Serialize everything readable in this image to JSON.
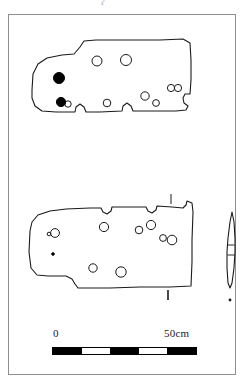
{
  "figure": {
    "domain_note": "archaeological artefact illustration plate",
    "top_cut_mark": "ʔ",
    "frame": {
      "x": 8,
      "y": 14,
      "width": 228,
      "height": 361,
      "border_color": "#8e8e8e"
    },
    "ink_color": "#1a1a1a",
    "fill_black": "#000000",
    "paper_color": "#ffffff"
  },
  "scale": {
    "zero_label": "0",
    "max_label": "50cm",
    "bar": {
      "x": 52,
      "y": 347,
      "width": 145,
      "height": 8,
      "segments": [
        {
          "tone": "dark",
          "weight": 1
        },
        {
          "tone": "light",
          "weight": 1
        },
        {
          "tone": "dark",
          "weight": 1
        },
        {
          "tone": "light",
          "weight": 1
        },
        {
          "tone": "dark",
          "weight": 1
        }
      ]
    }
  },
  "artefacts": {
    "upper_plan": {
      "label": "upper-stone-plan",
      "outline": "M 32 90 L 33 74 L 38 64 L 47 58 L 62 55 L 74 54 L 80 47 L 84 41 L 96 40 L 130 40 L 160 40 L 183 39 L 190 43 L 191 60 L 191 80 L 190 94 L 185 94 L 183 98 L 184 103 L 188 106 L 186 110 L 176 111 L 150 111 L 133 111 L 131 106 L 127 103 L 123 106 L 122 111 L 100 112 L 86 112 L 84 107 L 80 104 L 76 107 L 75 112 L 56 112 L 42 111 L 35 106 L 32 98 Z",
      "holes_open": [
        {
          "cx": 97,
          "cy": 61,
          "r": 5.0
        },
        {
          "cx": 126,
          "cy": 60,
          "r": 5.5
        },
        {
          "cx": 171,
          "cy": 88,
          "r": 3.6
        },
        {
          "cx": 178,
          "cy": 88,
          "r": 3.6
        },
        {
          "cx": 145,
          "cy": 96,
          "r": 4.2
        },
        {
          "cx": 156,
          "cy": 103,
          "r": 3.4
        },
        {
          "cx": 107,
          "cy": 103,
          "r": 3.8
        },
        {
          "cx": 68,
          "cy": 104,
          "r": 3.2
        }
      ],
      "holes_filled": [
        {
          "cx": 59,
          "cy": 78,
          "r": 5.5
        },
        {
          "cx": 61,
          "cy": 102,
          "r": 4.6
        }
      ]
    },
    "lower_plan": {
      "label": "lower-stone-plan",
      "outline": "M 30 231 L 32 222 L 38 215 L 50 211 L 66 209 L 90 208 L 101 208 L 103 212 L 107 214 L 111 211 L 112 207 L 128 207 L 146 207 L 148 211 L 152 213 L 156 210 L 157 206 L 172 207 L 183 208 L 186 205 L 187 201 L 192 203 L 193 212 L 192 240 L 192 262 L 191 286 L 170 287 L 140 287 L 110 288 L 78 288 L 75 284 L 72 279 L 66 276 L 48 276 L 37 275 L 31 268 L 29 252 Z",
      "holes_open": [
        {
          "cx": 55,
          "cy": 233,
          "r": 4.4
        },
        {
          "cx": 49,
          "cy": 234,
          "r": 1.8
        },
        {
          "cx": 104,
          "cy": 227,
          "r": 4.6
        },
        {
          "cx": 139,
          "cy": 230,
          "r": 3.8
        },
        {
          "cx": 151,
          "cy": 225,
          "r": 4.6
        },
        {
          "cx": 163,
          "cy": 238,
          "r": 3.4
        },
        {
          "cx": 172,
          "cy": 240,
          "r": 4.8
        },
        {
          "cx": 93,
          "cy": 268,
          "r": 4.2
        },
        {
          "cx": 121,
          "cy": 272,
          "r": 5.2
        }
      ],
      "holes_filled": [
        {
          "cx": 53,
          "cy": 254,
          "r": 1.3
        }
      ],
      "section_tick_top": {
        "x": 171,
        "y1": 194,
        "y2": 204
      },
      "section_tick_bottom": {
        "x": 168,
        "y1": 290,
        "y2": 300
      }
    },
    "side_profile": {
      "label": "stone-side-profile",
      "outline": "M 232 212 L 234 222 L 235 238 L 235 252 L 234 268 L 232 283 L 230 288 L 228 283 L 227 268 L 227 252 L 228 238 L 230 222 Z",
      "mid_lines": [
        {
          "x1": 227.6,
          "y1": 245,
          "x2": 234.6,
          "y2": 245
        },
        {
          "x1": 227.4,
          "y1": 255,
          "x2": 234.8,
          "y2": 255
        }
      ],
      "base_tick": {
        "cx": 230,
        "cy": 300
      }
    }
  }
}
